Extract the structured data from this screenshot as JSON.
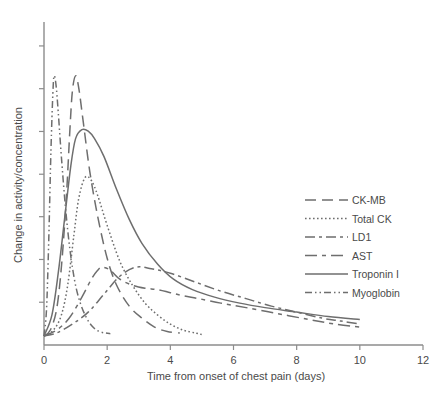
{
  "chart_data": {
    "type": "line",
    "title": "",
    "subtitle": "",
    "xlabel": "Time from onset of chest pain (days)",
    "ylabel": "Change in activity/concentration",
    "xlim": [
      0,
      12
    ],
    "ylim": [
      0,
      1.08
    ],
    "grid": false,
    "legend_position": "right-middle",
    "x_ticks": [
      "0",
      "2",
      "4",
      "6",
      "8",
      "10",
      "12"
    ],
    "x_tick_values": [
      0,
      2,
      4,
      6,
      8,
      10,
      12
    ],
    "y_ticks": [
      "",
      "",
      "",
      "",
      "",
      "",
      ""
    ],
    "y_tick_values": [
      0,
      0.143,
      0.286,
      0.429,
      0.571,
      0.714,
      0.857,
      1.0
    ],
    "y_axis_labeled": false,
    "annotations": [],
    "series": [
      {
        "name": "CK-MB",
        "dash": "long-dash",
        "dash_array": "11 6",
        "color": "#6e6e6e",
        "peak_day": 1.0,
        "peak_value": 0.9,
        "x": [
          0,
          0.2,
          0.4,
          0.55,
          0.7,
          0.82,
          0.9,
          1.0,
          1.1,
          1.25,
          1.45,
          1.7,
          2.0,
          2.3,
          2.7,
          3.1,
          3.5,
          3.9,
          4.3
        ],
        "values": [
          0.03,
          0.05,
          0.12,
          0.26,
          0.48,
          0.72,
          0.85,
          0.9,
          0.86,
          0.74,
          0.58,
          0.43,
          0.29,
          0.2,
          0.13,
          0.09,
          0.06,
          0.045,
          0.04
        ]
      },
      {
        "name": "Total CK",
        "dash": "dotted",
        "dash_array": "1.6 2.4",
        "color": "#6e6e6e",
        "peak_day": 1.3,
        "peak_value": 0.56,
        "x": [
          0,
          0.3,
          0.55,
          0.75,
          0.95,
          1.1,
          1.3,
          1.5,
          1.7,
          2.0,
          2.4,
          2.8,
          3.2,
          3.6,
          4.0,
          4.4,
          4.8,
          5.0
        ],
        "values": [
          0.03,
          0.05,
          0.1,
          0.2,
          0.37,
          0.49,
          0.56,
          0.55,
          0.5,
          0.4,
          0.28,
          0.2,
          0.14,
          0.1,
          0.07,
          0.05,
          0.04,
          0.035
        ]
      },
      {
        "name": "LD1",
        "dash": "dash-dot-long",
        "dash_array": "10 4 3 4",
        "color": "#6e6e6e",
        "peak_day": 2.9,
        "peak_value": 0.26,
        "x": [
          0,
          0.4,
          0.9,
          1.4,
          1.9,
          2.4,
          2.9,
          3.4,
          4.0,
          4.8,
          5.6,
          6.4,
          7.2,
          8.0,
          8.8,
          9.4,
          10.0
        ],
        "values": [
          0.03,
          0.04,
          0.07,
          0.11,
          0.17,
          0.23,
          0.26,
          0.255,
          0.24,
          0.21,
          0.18,
          0.155,
          0.13,
          0.11,
          0.09,
          0.08,
          0.07
        ]
      },
      {
        "name": "AST",
        "dash": "long-dash-short",
        "dash_array": "12 5 4 5",
        "color": "#6e6e6e",
        "peak_day": 1.85,
        "peak_value": 0.26,
        "x": [
          0,
          0.4,
          0.8,
          1.2,
          1.5,
          1.7,
          1.85,
          2.1,
          2.4,
          2.8,
          3.2,
          3.6,
          4.0,
          4.4,
          4.9,
          5.6,
          6.4,
          7.4,
          8.4,
          9.2,
          10.0
        ],
        "values": [
          0.03,
          0.05,
          0.09,
          0.16,
          0.22,
          0.25,
          0.26,
          0.25,
          0.22,
          0.2,
          0.19,
          0.185,
          0.175,
          0.165,
          0.155,
          0.14,
          0.125,
          0.105,
          0.085,
          0.07,
          0.06
        ]
      },
      {
        "name": "Troponin I",
        "dash": "solid",
        "dash_array": "",
        "color": "#6e6e6e",
        "peak_day": 1.2,
        "peak_value": 0.72,
        "x": [
          0,
          0.25,
          0.45,
          0.65,
          0.85,
          1.0,
          1.2,
          1.4,
          1.6,
          1.9,
          2.3,
          2.7,
          3.1,
          3.6,
          4.1,
          4.7,
          5.4,
          6.2,
          7.0,
          8.0,
          9.0,
          10.0
        ],
        "values": [
          0.03,
          0.1,
          0.24,
          0.42,
          0.6,
          0.69,
          0.72,
          0.715,
          0.69,
          0.63,
          0.52,
          0.42,
          0.34,
          0.27,
          0.22,
          0.185,
          0.16,
          0.14,
          0.125,
          0.11,
          0.095,
          0.085
        ]
      },
      {
        "name": "Myoglobin",
        "dash": "dash-dot-dot",
        "dash_array": "7 3 1.5 3 1.5 3",
        "color": "#6e6e6e",
        "peak_day": 0.32,
        "peak_value": 0.9,
        "x": [
          0,
          0.08,
          0.15,
          0.22,
          0.28,
          0.32,
          0.38,
          0.45,
          0.55,
          0.68,
          0.82,
          0.98,
          1.15,
          1.35,
          1.55,
          1.75,
          1.95,
          2.1
        ],
        "values": [
          0.03,
          0.12,
          0.35,
          0.65,
          0.84,
          0.9,
          0.87,
          0.78,
          0.63,
          0.46,
          0.32,
          0.21,
          0.14,
          0.09,
          0.06,
          0.045,
          0.04,
          0.038
        ]
      }
    ]
  },
  "legend": {
    "items": [
      {
        "label": "CK-MB"
      },
      {
        "label": "Total CK"
      },
      {
        "label": "LD1"
      },
      {
        "label": "AST"
      },
      {
        "label": "Troponin I"
      },
      {
        "label": "Myoglobin"
      }
    ]
  },
  "colors": {
    "line": "#6e6e6e",
    "axis": "#8c8c8c",
    "text": "#4a4a4a",
    "background": "#ffffff"
  }
}
